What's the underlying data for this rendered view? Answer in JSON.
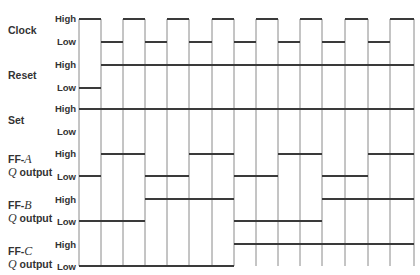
{
  "diagram": {
    "type": "timing-diagram",
    "level_labels": {
      "high": "High",
      "low": "Low"
    },
    "clock_edges_x": [
      79,
      101,
      123,
      145,
      167,
      189,
      212,
      234,
      256,
      278,
      300,
      322,
      345,
      368,
      390,
      414
    ],
    "signals": [
      {
        "id": "clock",
        "label_line1": "Clock",
        "label_line2": "",
        "high_y": 19,
        "low_y": 42,
        "label_y": 24,
        "segments": [
          [
            "H",
            79,
            101
          ],
          [
            "L",
            101,
            123
          ],
          [
            "H",
            123,
            145
          ],
          [
            "L",
            145,
            167
          ],
          [
            "H",
            167,
            189
          ],
          [
            "L",
            189,
            212
          ],
          [
            "H",
            212,
            234
          ],
          [
            "L",
            234,
            256
          ],
          [
            "H",
            256,
            278
          ],
          [
            "L",
            278,
            300
          ],
          [
            "H",
            300,
            322
          ],
          [
            "L",
            322,
            345
          ],
          [
            "H",
            345,
            368
          ],
          [
            "L",
            368,
            390
          ],
          [
            "H",
            390,
            414
          ]
        ]
      },
      {
        "id": "reset",
        "label_line1": "Reset",
        "label_line2": "",
        "high_y": 65,
        "low_y": 88,
        "label_y": 68,
        "segments": [
          [
            "L",
            79,
            101
          ],
          [
            "H",
            101,
            414
          ]
        ]
      },
      {
        "id": "set",
        "label_line1": "Set",
        "label_line2": "",
        "high_y": 109,
        "low_y": 131,
        "label_y": 115,
        "segments": [
          [
            "H",
            79,
            414
          ]
        ]
      },
      {
        "id": "ff-a",
        "label_line1": "FF-A",
        "label_prefix": "FF-",
        "label_var": "A",
        "label_line2_var": "Q",
        "label_line2_rest": " output",
        "high_y": 154,
        "low_y": 176,
        "label_y": 152,
        "segments": [
          [
            "L",
            79,
            101
          ],
          [
            "H",
            101,
            145
          ],
          [
            "L",
            145,
            189
          ],
          [
            "H",
            189,
            234
          ],
          [
            "L",
            234,
            278
          ],
          [
            "H",
            278,
            322
          ],
          [
            "L",
            322,
            368
          ],
          [
            "H",
            368,
            414
          ]
        ]
      },
      {
        "id": "ff-b",
        "label_line1": "FF-B",
        "label_prefix": "FF-",
        "label_var": "B",
        "label_line2_var": "Q",
        "label_line2_rest": " output",
        "high_y": 199,
        "low_y": 221,
        "label_y": 199,
        "segments": [
          [
            "L",
            79,
            145
          ],
          [
            "H",
            145,
            234
          ],
          [
            "L",
            234,
            322
          ],
          [
            "H",
            322,
            414
          ]
        ]
      },
      {
        "id": "ff-c",
        "label_line1": "FF-C",
        "label_prefix": "FF-",
        "label_var": "C",
        "label_line2_var": "Q",
        "label_line2_rest": " output",
        "high_y": 244,
        "low_y": 266,
        "label_y": 246,
        "segments": [
          [
            "L",
            79,
            234
          ],
          [
            "H",
            234,
            414
          ]
        ]
      }
    ],
    "line_color": "#3a3a3a",
    "grid_color": "#8a8a8a",
    "text_color": "#333333"
  }
}
